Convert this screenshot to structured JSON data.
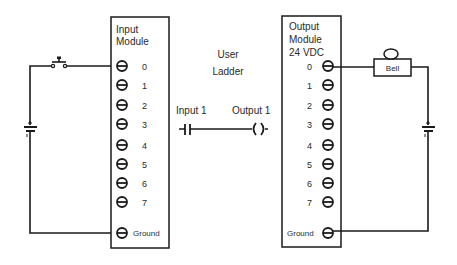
{
  "diagram": {
    "input_module": {
      "title_line1": "Input",
      "title_line2": "Module",
      "terminals": [
        "0",
        "1",
        "2",
        "3",
        "4",
        "5",
        "6",
        "7"
      ],
      "ground_label": "Ground"
    },
    "output_module": {
      "title_line1": "Output",
      "title_line2": "Module",
      "title_line3": "24  VDC",
      "terminals": [
        "0",
        "1",
        "2",
        "3",
        "4",
        "5",
        "6",
        "7"
      ],
      "ground_label": "Ground"
    },
    "ladder": {
      "title_line1": "User",
      "title_line2": "Ladder",
      "contact_label": "Input  1",
      "coil_label": "Output  1"
    },
    "input_circuit": {
      "switch": "push-button switch",
      "source": "battery"
    },
    "output_circuit": {
      "load_label": "Bell",
      "source": "battery"
    },
    "colors": {
      "line": "#1a1a1a",
      "text": "#2a2a2a",
      "background": "#ffffff"
    }
  }
}
